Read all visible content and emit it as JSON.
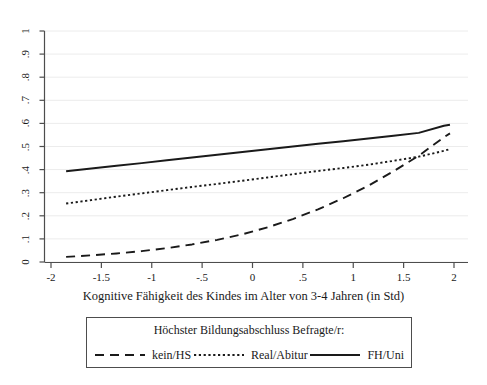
{
  "chart_data": {
    "type": "line",
    "title": "",
    "xlabel": "Kognitive Fähigkeit des Kindes im Alter von 3-4 Jahren (in Std)",
    "ylabel": "",
    "xlim": [
      -2,
      2
    ],
    "ylim": [
      0,
      1
    ],
    "xticks": [
      "-2",
      "-1.5",
      "-1",
      "-.5",
      "0",
      ".5",
      "1",
      "1.5",
      "2"
    ],
    "xtick_values": [
      -2,
      -1.5,
      -1,
      -0.5,
      0,
      0.5,
      1,
      1.5,
      2
    ],
    "yticks": [
      "0",
      ".1",
      ".2",
      ".3",
      ".4",
      ".5",
      ".6",
      ".7",
      ".8",
      ".9",
      "1"
    ],
    "ytick_values": [
      0,
      0.1,
      0.2,
      0.3,
      0.4,
      0.5,
      0.6,
      0.7,
      0.8,
      0.9,
      1
    ],
    "grid": "horizontal",
    "legend_position": "below-plot",
    "legend_title": "Höchster Bildungsabschluss Befragte/r:",
    "x": [
      -1.85,
      -1.6,
      -1.35,
      -1.1,
      -0.85,
      -0.6,
      -0.35,
      -0.1,
      0.15,
      0.4,
      0.65,
      0.9,
      1.15,
      1.4,
      1.65,
      1.9,
      1.96
    ],
    "series": [
      {
        "name": "kein/HS",
        "style": "dashed",
        "color": "#1a1a1a",
        "values": [
          0.022,
          0.029,
          0.037,
          0.047,
          0.06,
          0.076,
          0.096,
          0.12,
          0.15,
          0.186,
          0.228,
          0.276,
          0.33,
          0.393,
          0.46,
          0.54,
          0.557
        ]
      },
      {
        "name": "Real/Abitur",
        "style": "dotted",
        "color": "#1a1a1a",
        "values": [
          0.253,
          0.268,
          0.283,
          0.297,
          0.311,
          0.325,
          0.338,
          0.352,
          0.366,
          0.38,
          0.394,
          0.407,
          0.421,
          0.438,
          0.456,
          0.481,
          0.489
        ]
      },
      {
        "name": "FH/Uni",
        "style": "solid",
        "color": "#1a1a1a",
        "values": [
          0.393,
          0.405,
          0.417,
          0.428,
          0.44,
          0.452,
          0.464,
          0.476,
          0.488,
          0.5,
          0.512,
          0.523,
          0.535,
          0.547,
          0.559,
          0.59,
          0.594
        ]
      }
    ]
  },
  "axis": {
    "x_title": "Kognitive Fähigkeit des Kindes im Alter von 3-4 Jahren (in Std)",
    "x_ticks": [
      "-2",
      "-1.5",
      "-1",
      "-.5",
      "0",
      ".5",
      "1",
      "1.5",
      "2"
    ],
    "y_ticks": [
      "0",
      ".1",
      ".2",
      ".3",
      ".4",
      ".5",
      ".6",
      ".7",
      ".8",
      ".9",
      "1"
    ]
  },
  "legend": {
    "title": "Höchster Bildungsabschluss Befragte/r:",
    "entries": [
      {
        "label": "kein/HS",
        "style": "dashed"
      },
      {
        "label": "Real/Abitur",
        "style": "dotted"
      },
      {
        "label": "FH/Uni",
        "style": "solid"
      }
    ]
  },
  "colors": {
    "line": "#1a1a1a",
    "axis": "#4d4d4d",
    "grid": "#ececec",
    "background": "#ffffff"
  }
}
